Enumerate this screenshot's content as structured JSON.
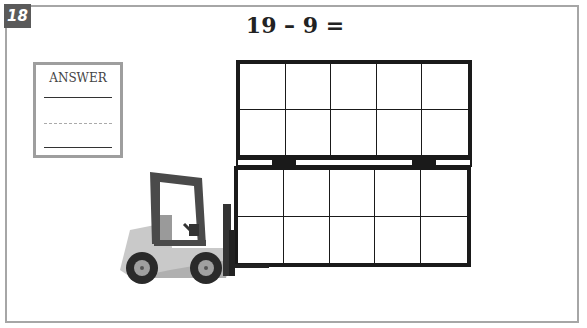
{
  "problem": {
    "number": "18",
    "equation": "19 – 9 ="
  },
  "answer_box": {
    "label": "ANSWER",
    "lines": [
      "solid",
      "dashed",
      "solid"
    ]
  },
  "ten_frames": [
    {
      "position": "top",
      "rows": 2,
      "columns": 5,
      "filled_cells": 0
    },
    {
      "position": "bottom",
      "rows": 2,
      "columns": 5,
      "filled_cells": 0
    }
  ],
  "illustration": {
    "subject": "forklift",
    "colors": {
      "body": "#c8c8c8",
      "frame": "#4a4a4a",
      "wheels": "#2a2a2a",
      "hubs": "#a0a0a0"
    }
  },
  "colors": {
    "badge_bg": "#5a5a5a",
    "frame_border": "#a6a6a6",
    "grid_line": "#1a1a1a"
  }
}
